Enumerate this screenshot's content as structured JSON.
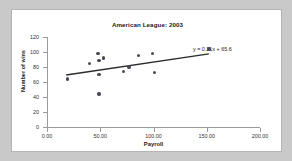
{
  "chart_data": {
    "type": "scatter",
    "title": "American League: 2003",
    "xlabel": "Payroll",
    "ylabel": "Number of wins",
    "xlim": [
      0,
      200
    ],
    "ylim": [
      0,
      120
    ],
    "xticks": [
      "0.00",
      "50.00",
      "100.00",
      "150.00",
      "200.00"
    ],
    "xtick_values": [
      0,
      50,
      100,
      150,
      200
    ],
    "yticks": [
      "0",
      "20",
      "40",
      "60",
      "80",
      "100",
      "120"
    ],
    "ytick_values": [
      0,
      20,
      40,
      60,
      80,
      100,
      120
    ],
    "grid": false,
    "legend": null,
    "annotations": [
      {
        "text": "y = 0.21x + 65.6",
        "x": 150,
        "y": 113
      }
    ],
    "trendline": {
      "equation": "y = 0.21x + 65.6",
      "slope": 0.21,
      "intercept": 65.6,
      "x_start": 18,
      "x_end": 152
    },
    "points": [
      {
        "x": 19,
        "y": 64
      },
      {
        "x": 40,
        "y": 85
      },
      {
        "x": 48,
        "y": 98
      },
      {
        "x": 49,
        "y": 89
      },
      {
        "x": 53,
        "y": 92
      },
      {
        "x": 49,
        "y": 70
      },
      {
        "x": 49,
        "y": 44
      },
      {
        "x": 72,
        "y": 74
      },
      {
        "x": 77,
        "y": 80
      },
      {
        "x": 86,
        "y": 95
      },
      {
        "x": 99,
        "y": 98
      },
      {
        "x": 101,
        "y": 73
      },
      {
        "x": 152,
        "y": 104
      }
    ],
    "marker_color": "#4a4a56",
    "line_color": "#2b2b2b"
  }
}
